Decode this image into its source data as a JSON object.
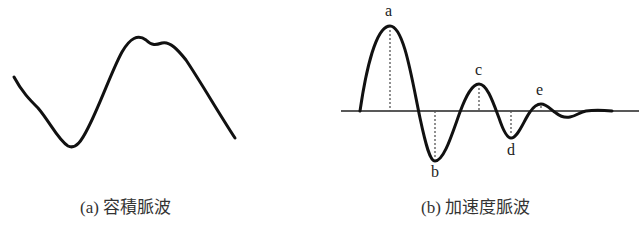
{
  "panels": [
    {
      "id": "a",
      "caption": "(a)  容積脈波",
      "type": "waveform",
      "description": "Plethysmogram (volume pulse wave)"
    },
    {
      "id": "b",
      "caption": "(b)  加速度脈波",
      "type": "waveform",
      "description": "Acceleration pulse wave (second derivative)",
      "points": [
        {
          "label": "a"
        },
        {
          "label": "b"
        },
        {
          "label": "c"
        },
        {
          "label": "d"
        },
        {
          "label": "e"
        }
      ]
    }
  ],
  "colors": {
    "line": "#111111",
    "guide": "#555555",
    "background": "#ffffff"
  }
}
